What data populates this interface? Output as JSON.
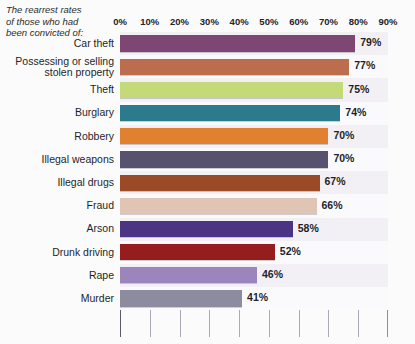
{
  "caption": {
    "lines": [
      "The rearrest rates",
      "of those who had",
      "been convicted of:"
    ]
  },
  "chart_data": {
    "type": "bar",
    "orientation": "horizontal",
    "xlabel": "",
    "ylabel": "",
    "xlim": [
      0,
      90
    ],
    "grid": true,
    "legend": "none",
    "tick_labels": [
      "0%",
      "10%",
      "20%",
      "30%",
      "40%",
      "50%",
      "60%",
      "70%",
      "80%",
      "90%"
    ],
    "tick_values": [
      0,
      10,
      20,
      30,
      40,
      50,
      60,
      70,
      80,
      90
    ],
    "categories": [
      "Car theft",
      "Possessing or selling stolen property",
      "Theft",
      "Burglary",
      "Robbery",
      "Illegal weapons",
      "Illegal drugs",
      "Fraud",
      "Arson",
      "Drunk driving",
      "Rape",
      "Murder"
    ],
    "values": [
      79,
      77,
      75,
      74,
      70,
      70,
      67,
      66,
      58,
      52,
      46,
      41
    ],
    "value_labels": [
      "79%",
      "77%",
      "75%",
      "74%",
      "70%",
      "70%",
      "67%",
      "66%",
      "58%",
      "52%",
      "46%",
      "41%"
    ],
    "bars": [
      {
        "label": "Car theft",
        "label_lines": [
          "Car theft"
        ],
        "value": 79,
        "value_label": "79%",
        "color": "#7e4672"
      },
      {
        "label": "Possessing or selling stolen property",
        "label_lines": [
          "Possessing or selling",
          "stolen property"
        ],
        "value": 77,
        "value_label": "77%",
        "color": "#bb6d4d"
      },
      {
        "label": "Theft",
        "label_lines": [
          "Theft"
        ],
        "value": 75,
        "value_label": "75%",
        "color": "#c4d977"
      },
      {
        "label": "Burglary",
        "label_lines": [
          "Burglary"
        ],
        "value": 74,
        "value_label": "74%",
        "color": "#2b7b8c"
      },
      {
        "label": "Robbery",
        "label_lines": [
          "Robbery"
        ],
        "value": 70,
        "value_label": "70%",
        "color": "#e1812f"
      },
      {
        "label": "Illegal weapons",
        "label_lines": [
          "Illegal weapons"
        ],
        "value": 70,
        "value_label": "70%",
        "color": "#57526f"
      },
      {
        "label": "Illegal drugs",
        "label_lines": [
          "Illegal drugs"
        ],
        "value": 67,
        "value_label": "67%",
        "color": "#9b4a27"
      },
      {
        "label": "Fraud",
        "label_lines": [
          "Fraud"
        ],
        "value": 66,
        "value_label": "66%",
        "color": "#e0c4b4"
      },
      {
        "label": "Arson",
        "label_lines": [
          "Arson"
        ],
        "value": 58,
        "value_label": "58%",
        "color": "#4b3484"
      },
      {
        "label": "Drunk driving",
        "label_lines": [
          "Drunk driving"
        ],
        "value": 52,
        "value_label": "52%",
        "color": "#961d1d"
      },
      {
        "label": "Rape",
        "label_lines": [
          "Rape"
        ],
        "value": 46,
        "value_label": "46%",
        "color": "#9c84bd"
      },
      {
        "label": "Murder",
        "label_lines": [
          "Murder"
        ],
        "value": 41,
        "value_label": "41%",
        "color": "#8c8ba0"
      }
    ]
  },
  "colors": {
    "page_background": "#fbfbfc",
    "plot_band_odd": "#f2f0f5",
    "plot_band_even": "#fafafc",
    "gridline": "#a9a9b8",
    "axis": "#5c5c66",
    "text": "#1f1f27"
  }
}
